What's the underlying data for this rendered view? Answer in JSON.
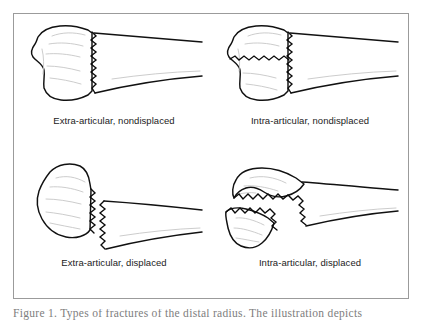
{
  "figure": {
    "type": "medical-illustration",
    "layout": "2x2 grid",
    "frame_color": "#9b9b9b",
    "background_color": "#ffffff",
    "line_color": "#111111",
    "detail_line_color": "#c6c6c6",
    "text_color": "#1b1b1b"
  },
  "panels": [
    {
      "id": "top-left",
      "label": "Extra-articular, nondisplaced",
      "articular_involvement": "extra-articular",
      "displacement": "nondisplaced",
      "fracture_pattern": "single transverse jagged fracture line across the metaphysis, fragments aligned"
    },
    {
      "id": "top-right",
      "label": "Intra-articular, nondisplaced",
      "articular_involvement": "intra-articular",
      "displacement": "nondisplaced",
      "fracture_pattern": "transverse jagged fracture line with a second jagged line extending into the articular surface, fragments aligned"
    },
    {
      "id": "bottom-left",
      "label": "Extra-articular, displaced",
      "articular_involvement": "extra-articular",
      "displacement": "displaced",
      "fracture_pattern": "transverse jagged fracture with the distal fragment separated and offset from the shaft"
    },
    {
      "id": "bottom-right",
      "label": "Intra-articular, displaced",
      "articular_involvement": "intra-articular",
      "displacement": "displaced",
      "fracture_pattern": "articular-surface fracture with the distal fragment separated and displaced volarly"
    }
  ],
  "caption": {
    "text": "Figure 1. Types of fractures of the distal radius. The illustration depicts",
    "visible": "partially cropped"
  }
}
